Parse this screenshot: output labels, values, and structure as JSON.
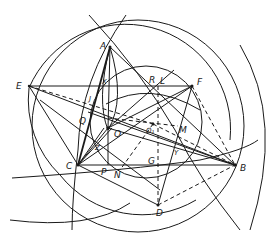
{
  "figure": {
    "type": "geometric-construction",
    "points": [
      {
        "id": "A",
        "label": "A"
      },
      {
        "id": "B",
        "label": "B"
      },
      {
        "id": "C",
        "label": "C"
      },
      {
        "id": "D",
        "label": "D"
      },
      {
        "id": "E",
        "label": "E"
      },
      {
        "id": "F",
        "label": "F"
      },
      {
        "id": "G",
        "label": "G"
      },
      {
        "id": "J",
        "label": "J"
      },
      {
        "id": "L",
        "label": "L"
      },
      {
        "id": "M",
        "label": "M"
      },
      {
        "id": "N",
        "label": "N"
      },
      {
        "id": "O",
        "label": "O"
      },
      {
        "id": "O1",
        "label": "O₁"
      },
      {
        "id": "P",
        "label": "P"
      },
      {
        "id": "Q",
        "label": "Q"
      },
      {
        "id": "R",
        "label": "R"
      },
      {
        "id": "X",
        "label": "X"
      },
      {
        "id": "Y",
        "label": "Y"
      },
      {
        "id": "Z",
        "label": "Z"
      }
    ],
    "segments_solid": [
      [
        "E",
        "F"
      ],
      [
        "C",
        "B"
      ],
      [
        "A",
        "C"
      ],
      [
        "A",
        "B"
      ],
      [
        "E",
        "B"
      ],
      [
        "E",
        "C"
      ],
      [
        "F",
        "C"
      ],
      [
        "F",
        "D"
      ],
      [
        "C",
        "D"
      ],
      [
        "O",
        "B"
      ],
      [
        "O",
        "P"
      ],
      [
        "O",
        "F"
      ],
      [
        "O",
        "C"
      ],
      [
        "A",
        "O"
      ],
      [
        "Q",
        "B"
      ],
      [
        "C",
        "Z"
      ],
      [
        "N",
        "C"
      ]
    ],
    "segments_dashed": [
      [
        "E",
        "O1"
      ],
      [
        "F",
        "B"
      ],
      [
        "D",
        "B"
      ],
      [
        "L",
        "D"
      ],
      [
        "O",
        "M"
      ],
      [
        "O1",
        "N"
      ]
    ],
    "labels": {
      "A": "A",
      "B": "B",
      "C": "C",
      "D": "D",
      "E": "E",
      "F": "F",
      "G": "G",
      "J": "J",
      "L": "L",
      "M": "M",
      "N": "N",
      "O": "O",
      "O1": "O₁",
      "P": "P",
      "Q": "Q",
      "R": "R",
      "X": "X",
      "Y": "Y",
      "Z": "Z"
    }
  }
}
